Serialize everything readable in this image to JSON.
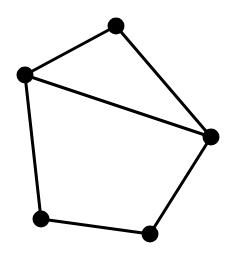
{
  "diagram": {
    "type": "undirected-graph",
    "background": "#ffffff",
    "stroke_color": "#000000",
    "node_color": "#000000",
    "node_radius": 8.5,
    "edge_width": 3,
    "nodes": [
      {
        "id": "top",
        "x": 116,
        "y": 26
      },
      {
        "id": "left",
        "x": 25,
        "y": 75
      },
      {
        "id": "right",
        "x": 211,
        "y": 137
      },
      {
        "id": "bottom-left",
        "x": 41,
        "y": 219
      },
      {
        "id": "bottom-right",
        "x": 150,
        "y": 234
      }
    ],
    "edges": [
      {
        "from": "top",
        "to": "left"
      },
      {
        "from": "top",
        "to": "right"
      },
      {
        "from": "left",
        "to": "right"
      },
      {
        "from": "left",
        "to": "bottom-left"
      },
      {
        "from": "bottom-left",
        "to": "bottom-right"
      },
      {
        "from": "bottom-right",
        "to": "right"
      }
    ]
  }
}
